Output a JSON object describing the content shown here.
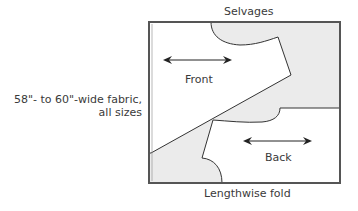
{
  "diagram": {
    "title_top": "Selvages",
    "title_bottom": "Lengthwise fold",
    "side_label_line1": "58\"- to 60\"-wide fabric,",
    "side_label_line2": "all sizes",
    "pieces": [
      {
        "name": "Front",
        "grainline": "double-headed horizontal arrow"
      },
      {
        "name": "Back",
        "grainline": "double-headed horizontal arrow"
      }
    ],
    "colors": {
      "fabric_fill": "#ebebeb",
      "piece_fill": "#ffffff",
      "outline": "#333333",
      "frame": "#555555"
    }
  }
}
